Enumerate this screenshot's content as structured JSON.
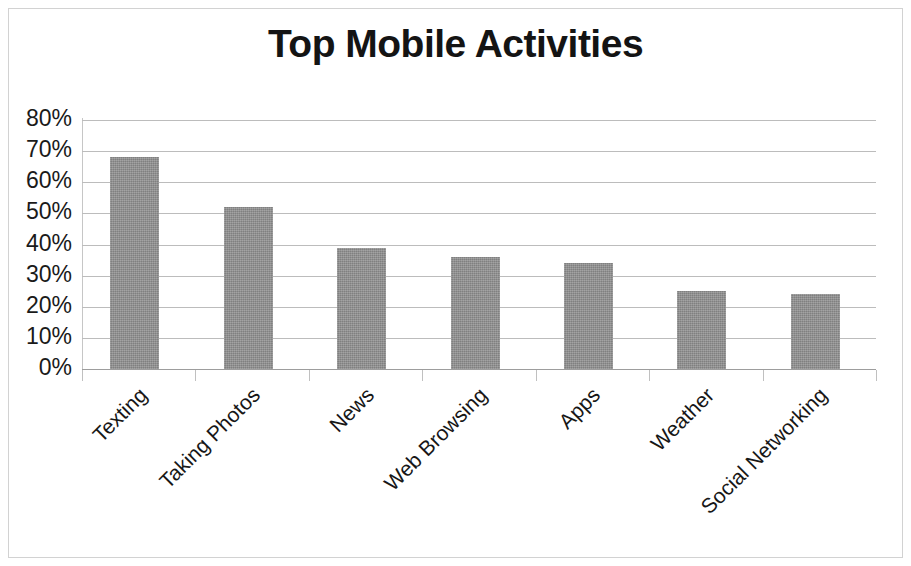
{
  "chart_data": {
    "type": "bar",
    "title": "Top Mobile Activities",
    "xlabel": "",
    "ylabel": "",
    "categories": [
      "Texting",
      "Taking Photos",
      "News",
      "Web Browsing",
      "Apps",
      "Weather",
      "Social Networking"
    ],
    "values": [
      68,
      52,
      39,
      36,
      34,
      25,
      24
    ],
    "value_format": "percent",
    "ylim": [
      0,
      80
    ],
    "ytick_labels": [
      "80%",
      "70%",
      "60%",
      "50%",
      "40%",
      "30%",
      "20%",
      "10%",
      "0%"
    ],
    "ytick_values": [
      80,
      70,
      60,
      50,
      40,
      30,
      20,
      10,
      0
    ],
    "grid": true,
    "legend": false,
    "legend_position": "none",
    "bar_color": "#8f8f8f",
    "gridline_color": "#bcbcbc",
    "title_color": "#141414",
    "background_color": "#ffffff",
    "border_color": "#d2d2d2",
    "xtick_label_rotation": "-45"
  }
}
